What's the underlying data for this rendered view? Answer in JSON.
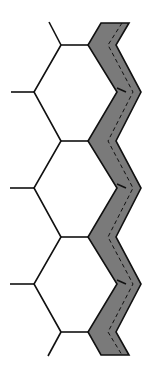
{
  "diagram": {
    "title": "",
    "colors": {
      "background": "#ffffff",
      "line": "#111111",
      "band_fill": "#7a7a7a",
      "dashed_line": "#111111"
    },
    "cells": {
      "count": 3,
      "shape": "hexagon"
    },
    "band": {
      "style": "shaded zig-zag",
      "dashed_line": true,
      "inner_ticks": 3
    }
  }
}
